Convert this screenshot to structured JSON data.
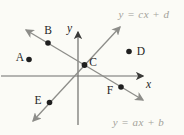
{
  "figure": {
    "type": "coordinate-plane-diagram",
    "axes": {
      "x_label": "x",
      "y_label": "y"
    },
    "lines": [
      {
        "name": "rising-line",
        "equation": "y = cx + d",
        "slope_sign": "positive"
      },
      {
        "name": "falling-line",
        "equation": "y = ax + b",
        "slope_sign": "negative"
      }
    ],
    "points": [
      {
        "label": "A"
      },
      {
        "label": "B"
      },
      {
        "label": "C"
      },
      {
        "label": "D"
      },
      {
        "label": "E"
      },
      {
        "label": "F"
      }
    ],
    "colors": {
      "bg": "#fbfbf6",
      "ink": "#1f1f1f",
      "line": "#8d8d89",
      "axis": "#6f6f6c",
      "equation": "#a3a29a"
    }
  }
}
